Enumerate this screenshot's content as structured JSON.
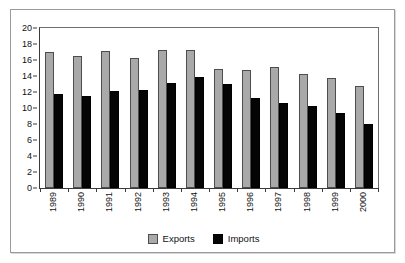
{
  "chart_data": {
    "type": "bar",
    "title": "",
    "subtitle": "",
    "xlabel": "",
    "ylabel": "",
    "categories": [
      "1989",
      "1990",
      "1991",
      "1992",
      "1993",
      "1994",
      "1995",
      "1996",
      "1997",
      "1998",
      "1999",
      "2000"
    ],
    "series": [
      {
        "name": "Exports",
        "color": "#a9a9a9",
        "values": [
          17.0,
          16.5,
          17.1,
          16.3,
          17.2,
          17.2,
          14.9,
          14.7,
          15.1,
          14.3,
          13.7,
          12.7
        ]
      },
      {
        "name": "Imports",
        "color": "#050505",
        "values": [
          11.8,
          11.5,
          12.1,
          12.2,
          13.1,
          13.9,
          13.0,
          11.3,
          10.6,
          10.2,
          9.4,
          8.0
        ]
      }
    ],
    "ylim": [
      0,
      20
    ],
    "ytick_step": 2,
    "yticks": [
      "0",
      "2",
      "4",
      "6",
      "8",
      "10",
      "12",
      "14",
      "16",
      "18",
      "20"
    ],
    "grid": false,
    "legend_position": "bottom",
    "legend": [
      "Exports",
      "Imports"
    ]
  }
}
